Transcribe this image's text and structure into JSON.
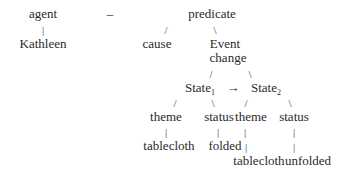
{
  "diagram": {
    "type": "semantic-structure-tree",
    "nodes": {
      "agent": "agent",
      "dash": "–",
      "predicate": "predicate",
      "kathleen": "Kathleen",
      "cause": "cause",
      "event": "Event",
      "change": "change",
      "state1": "State",
      "state1_sub": "1",
      "arrow": "→",
      "state2": "State",
      "state2_sub": "2",
      "theme1": "theme",
      "status1": "status",
      "theme2": "theme",
      "status2": "status",
      "tablecloth1": "tablecloth",
      "folded": "folded",
      "tablecloth2": "tablecloth",
      "unfolded": "unfolded"
    },
    "edges": {
      "pipe": "|",
      "slash": "/",
      "backslash": "\\"
    },
    "relations": [
      {
        "from": "agent",
        "to": "Kathleen"
      },
      {
        "from": "predicate",
        "to": "cause"
      },
      {
        "from": "predicate",
        "to": "Event change"
      },
      {
        "from": "Event change",
        "to": "State1"
      },
      {
        "from": "Event change",
        "to": "State2"
      },
      {
        "from": "State1",
        "to": "State2",
        "label": "→"
      },
      {
        "from": "State1",
        "to": "theme"
      },
      {
        "from": "State1",
        "to": "status"
      },
      {
        "from": "State2",
        "to": "theme"
      },
      {
        "from": "State2",
        "to": "status"
      },
      {
        "from": "theme (State1)",
        "to": "tablecloth"
      },
      {
        "from": "status (State1)",
        "to": "folded"
      },
      {
        "from": "theme (State2)",
        "to": "tablecloth"
      },
      {
        "from": "status (State2)",
        "to": "unfolded"
      }
    ]
  }
}
